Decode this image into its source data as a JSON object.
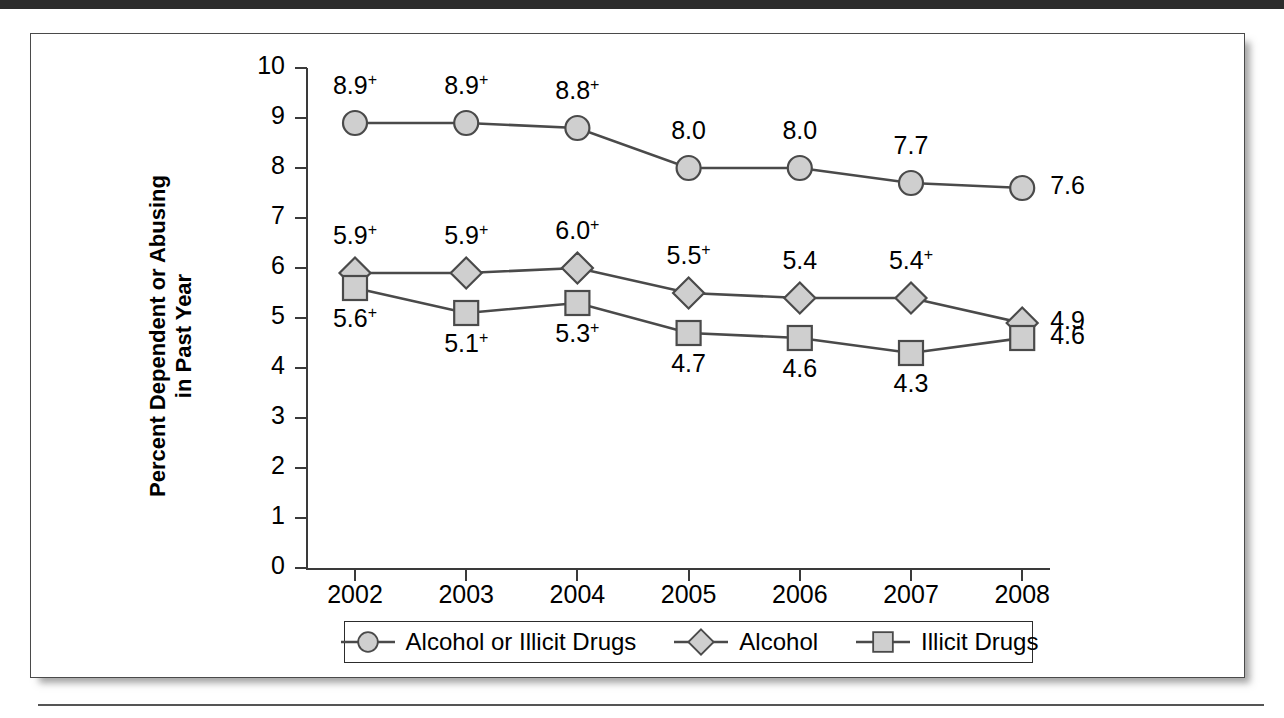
{
  "figure": {
    "y_axis_title_line1": "Percent Dependent or Abusing",
    "y_axis_title_line2": "in Past Year"
  },
  "chart_data": {
    "type": "line",
    "title": "",
    "xlabel": "",
    "ylabel": "Percent Dependent or Abusing in Past Year",
    "categories": [
      "2002",
      "2003",
      "2004",
      "2005",
      "2006",
      "2007",
      "2008"
    ],
    "ylim": [
      0,
      10
    ],
    "yticks": [
      "0",
      "1",
      "2",
      "3",
      "4",
      "5",
      "6",
      "7",
      "8",
      "9",
      "10"
    ],
    "grid": false,
    "legend_position": "bottom",
    "series": [
      {
        "name": "Alcohol or Illicit Drugs",
        "marker": "circle",
        "values": [
          8.9,
          8.9,
          8.8,
          8.0,
          8.0,
          7.7,
          7.6
        ],
        "labels": [
          "8.9",
          "8.9",
          "8.8",
          "8.0",
          "8.0",
          "7.7",
          "7.6"
        ],
        "significance": [
          "+",
          "+",
          "+",
          "",
          "",
          "",
          ""
        ]
      },
      {
        "name": "Alcohol",
        "marker": "diamond",
        "values": [
          5.9,
          5.9,
          6.0,
          5.5,
          5.4,
          5.4,
          4.9
        ],
        "labels": [
          "5.9",
          "5.9",
          "6.0",
          "5.5",
          "5.4",
          "5.4",
          "4.9"
        ],
        "significance": [
          "+",
          "+",
          "+",
          "+",
          "",
          "+",
          ""
        ]
      },
      {
        "name": "Illicit Drugs",
        "marker": "square",
        "values": [
          5.6,
          5.1,
          5.3,
          4.7,
          4.6,
          4.3,
          4.6
        ],
        "labels": [
          "5.6",
          "5.1",
          "5.3",
          "4.7",
          "4.6",
          "4.3",
          "4.6"
        ],
        "significance": [
          "+",
          "+",
          "+",
          "",
          "",
          "",
          ""
        ]
      }
    ],
    "colors": {
      "line": "#4a4a4a",
      "marker_fill": "#cfcfcf",
      "marker_stroke": "#4a4a4a",
      "text": "#000000"
    }
  },
  "legend": {
    "entries": [
      {
        "label": "Alcohol or Illicit Drugs",
        "marker": "circle"
      },
      {
        "label": "Alcohol",
        "marker": "diamond"
      },
      {
        "label": "Illicit Drugs",
        "marker": "square"
      }
    ]
  }
}
